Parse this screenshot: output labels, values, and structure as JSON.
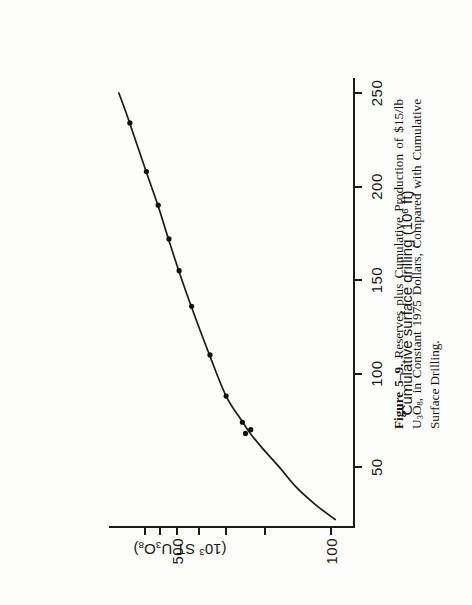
{
  "figure": {
    "caption_label": "Figure 5–9.",
    "caption_text": "Reserves plus Cumulative Production of $15/lb U3O8, in Constant 1975 Dollars, Compared with Cumulative Surface Drilling."
  },
  "chart_data": {
    "type": "line",
    "title": "",
    "xlabel": "Cumulative surface drilling (10^6 ft)",
    "ylabel": "(10^3 ST U3O8)",
    "yscale": "log",
    "xscale": "linear",
    "grid": false,
    "legend": "none",
    "xlim": [
      18,
      258
    ],
    "ylim": [
      78,
      1020
    ],
    "xticks": [
      50,
      100,
      150,
      200,
      250
    ],
    "xticklabels": [
      "50",
      "100",
      "150",
      "200",
      "250"
    ],
    "yticks": [
      100,
      200,
      300,
      400,
      500,
      600,
      700
    ],
    "yticklabels": [
      "100",
      "",
      "",
      "",
      "500",
      "",
      ""
    ],
    "ylabeled_ticks": [
      {
        "value": 100,
        "label": "100"
      },
      {
        "value": 500,
        "label": "500"
      }
    ],
    "x": [
      68,
      70,
      74,
      88,
      110,
      136,
      155,
      172,
      190,
      208,
      234
    ],
    "y": [
      245,
      232,
      253,
      300,
      355,
      430,
      490,
      545,
      610,
      690,
      820
    ],
    "points": [
      {
        "x": 68,
        "y": 245
      },
      {
        "x": 70,
        "y": 232
      },
      {
        "x": 74,
        "y": 253
      },
      {
        "x": 88,
        "y": 300
      },
      {
        "x": 110,
        "y": 355
      },
      {
        "x": 136,
        "y": 430
      },
      {
        "x": 155,
        "y": 490
      },
      {
        "x": 172,
        "y": 545
      },
      {
        "x": 190,
        "y": 610
      },
      {
        "x": 208,
        "y": 690
      },
      {
        "x": 234,
        "y": 820
      }
    ],
    "curve": [
      {
        "x": 22,
        "y": 96
      },
      {
        "x": 30,
        "y": 118
      },
      {
        "x": 40,
        "y": 146
      },
      {
        "x": 50,
        "y": 172
      },
      {
        "x": 60,
        "y": 205
      },
      {
        "x": 68,
        "y": 233
      },
      {
        "x": 74,
        "y": 252
      },
      {
        "x": 88,
        "y": 300
      },
      {
        "x": 110,
        "y": 357
      },
      {
        "x": 136,
        "y": 432
      },
      {
        "x": 155,
        "y": 492
      },
      {
        "x": 172,
        "y": 548
      },
      {
        "x": 190,
        "y": 612
      },
      {
        "x": 208,
        "y": 692
      },
      {
        "x": 234,
        "y": 822
      },
      {
        "x": 250,
        "y": 920
      }
    ],
    "series_name": "Reserves plus cumulative production",
    "marker": "filled-circle",
    "line_color": "#1b1b1b",
    "marker_color": "#101010"
  },
  "axes": {
    "x_title": "Cumulative surface drilling (10",
    "x_title_sup": "6",
    "x_title_tail": " ft)",
    "y_title_lead": "(10",
    "y_title_sup": "3",
    "y_title_mid": " ST U",
    "y_title_sub1": "3",
    "y_title_mid2": "O",
    "y_title_sub2": "8",
    "y_title_tail": ")"
  },
  "caption_parts": {
    "figure_number": "Figure 5–9.",
    "line1": "Reserves plus Cumulative Production of $15/lb U",
    "sub1": "3",
    "line1b": "O",
    "sub2": "8",
    "line1c": ", in",
    "line2": "Constant 1975 Dollars, Compared with Cumulative Surface",
    "line3": "Drilling."
  },
  "colors": {
    "ink": "#1b1b1b",
    "paper": "#fdfdfc"
  }
}
